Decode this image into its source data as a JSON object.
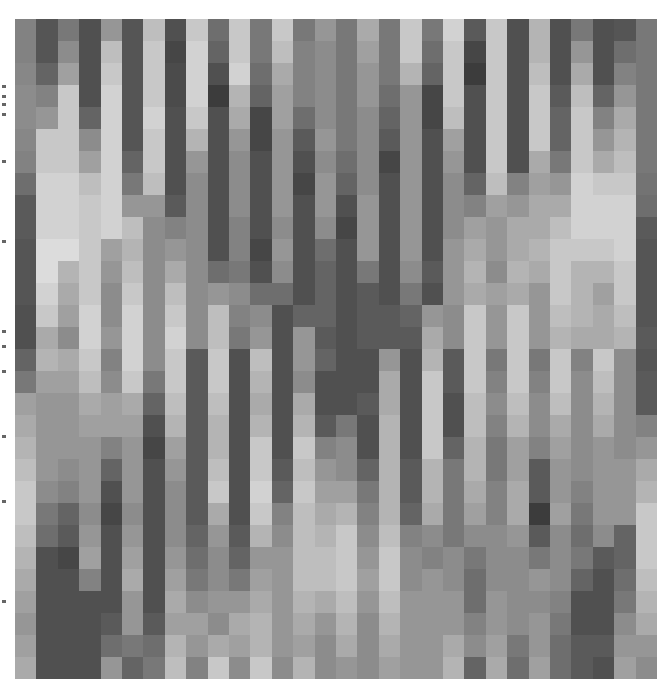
{
  "image": {
    "description": "grayscale pixel mosaic (30x30 grid of gray tiles)",
    "rows": 30,
    "cols": 30,
    "edge_marks_y": [
      85,
      95,
      103,
      113,
      160,
      240,
      330,
      345,
      370,
      435,
      500,
      600
    ]
  },
  "chart_data": {
    "type": "heatmap",
    "title": "",
    "xlabel": "",
    "ylabel": "",
    "colormap": "gray",
    "value_range": [
      0,
      255
    ],
    "grid": false,
    "matrix": [
      [
        130,
        85,
        120,
        80,
        150,
        85,
        190,
        80,
        200,
        110,
        200,
        120,
        200,
        120,
        150,
        120,
        170,
        120,
        200,
        120,
        210,
        90,
        200,
        80,
        180,
        80,
        120,
        80,
        85,
        120
      ],
      [
        130,
        85,
        140,
        80,
        190,
        85,
        200,
        70,
        210,
        100,
        200,
        120,
        190,
        130,
        140,
        120,
        160,
        120,
        200,
        110,
        200,
        70,
        200,
        80,
        180,
        80,
        150,
        80,
        110,
        120
      ],
      [
        135,
        100,
        160,
        80,
        200,
        85,
        200,
        75,
        210,
        80,
        210,
        110,
        170,
        130,
        140,
        120,
        150,
        120,
        180,
        100,
        200,
        60,
        200,
        80,
        190,
        80,
        170,
        80,
        130,
        120
      ],
      [
        140,
        130,
        200,
        80,
        210,
        85,
        200,
        75,
        210,
        60,
        180,
        100,
        160,
        130,
        140,
        120,
        150,
        110,
        150,
        70,
        200,
        80,
        200,
        80,
        200,
        90,
        190,
        100,
        150,
        120
      ],
      [
        140,
        150,
        200,
        100,
        210,
        85,
        210,
        80,
        200,
        80,
        170,
        70,
        160,
        110,
        140,
        120,
        140,
        100,
        150,
        70,
        190,
        80,
        200,
        80,
        200,
        100,
        200,
        130,
        170,
        120
      ],
      [
        135,
        200,
        200,
        140,
        210,
        85,
        200,
        80,
        180,
        80,
        150,
        70,
        150,
        90,
        150,
        120,
        140,
        90,
        150,
        80,
        160,
        80,
        200,
        80,
        200,
        100,
        200,
        150,
        180,
        120
      ],
      [
        130,
        200,
        200,
        160,
        210,
        100,
        200,
        80,
        150,
        80,
        140,
        80,
        150,
        80,
        140,
        110,
        140,
        70,
        150,
        80,
        150,
        80,
        200,
        80,
        170,
        120,
        200,
        170,
        190,
        120
      ],
      [
        110,
        210,
        210,
        190,
        210,
        120,
        190,
        80,
        140,
        80,
        140,
        80,
        150,
        70,
        150,
        100,
        140,
        80,
        150,
        80,
        140,
        100,
        190,
        130,
        160,
        150,
        210,
        200,
        200,
        115
      ],
      [
        90,
        210,
        210,
        200,
        210,
        150,
        150,
        90,
        140,
        80,
        140,
        80,
        150,
        80,
        150,
        80,
        150,
        80,
        150,
        80,
        140,
        130,
        160,
        150,
        170,
        170,
        210,
        210,
        210,
        110
      ],
      [
        90,
        210,
        210,
        200,
        210,
        190,
        140,
        130,
        140,
        80,
        130,
        80,
        140,
        80,
        140,
        70,
        150,
        80,
        150,
        80,
        140,
        160,
        150,
        170,
        170,
        190,
        210,
        210,
        210,
        90
      ],
      [
        85,
        220,
        220,
        200,
        160,
        180,
        140,
        150,
        140,
        80,
        130,
        70,
        150,
        80,
        110,
        80,
        150,
        80,
        150,
        80,
        150,
        170,
        150,
        170,
        180,
        200,
        200,
        200,
        210,
        85
      ],
      [
        85,
        220,
        180,
        200,
        150,
        190,
        140,
        170,
        140,
        110,
        120,
        80,
        140,
        80,
        100,
        80,
        120,
        80,
        140,
        90,
        150,
        180,
        140,
        180,
        170,
        200,
        180,
        180,
        200,
        85
      ],
      [
        85,
        210,
        170,
        200,
        140,
        200,
        140,
        190,
        140,
        150,
        140,
        110,
        110,
        80,
        100,
        80,
        90,
        80,
        120,
        80,
        150,
        170,
        160,
        170,
        150,
        200,
        180,
        160,
        200,
        85
      ],
      [
        80,
        200,
        160,
        210,
        140,
        210,
        140,
        200,
        140,
        190,
        130,
        140,
        80,
        100,
        100,
        80,
        90,
        90,
        100,
        150,
        140,
        200,
        150,
        200,
        150,
        190,
        180,
        170,
        190,
        85
      ],
      [
        80,
        170,
        140,
        210,
        150,
        210,
        140,
        210,
        140,
        190,
        120,
        150,
        80,
        150,
        90,
        80,
        90,
        90,
        90,
        170,
        140,
        200,
        150,
        200,
        150,
        180,
        170,
        170,
        180,
        90
      ],
      [
        100,
        180,
        170,
        200,
        130,
        210,
        140,
        200,
        90,
        200,
        80,
        190,
        80,
        150,
        100,
        80,
        80,
        150,
        80,
        180,
        90,
        200,
        120,
        200,
        120,
        200,
        130,
        200,
        140,
        85
      ],
      [
        120,
        160,
        160,
        190,
        140,
        200,
        120,
        200,
        90,
        200,
        80,
        180,
        80,
        140,
        80,
        80,
        80,
        170,
        80,
        200,
        90,
        200,
        130,
        200,
        130,
        200,
        140,
        190,
        140,
        90
      ],
      [
        160,
        150,
        150,
        170,
        160,
        170,
        100,
        190,
        90,
        190,
        80,
        170,
        80,
        170,
        80,
        80,
        90,
        170,
        80,
        200,
        80,
        190,
        140,
        190,
        140,
        190,
        140,
        180,
        140,
        90
      ],
      [
        170,
        150,
        150,
        160,
        160,
        160,
        80,
        180,
        90,
        180,
        80,
        180,
        80,
        180,
        90,
        120,
        80,
        180,
        80,
        200,
        80,
        190,
        130,
        180,
        140,
        170,
        140,
        170,
        140,
        130
      ],
      [
        180,
        150,
        150,
        150,
        130,
        150,
        70,
        160,
        90,
        180,
        80,
        200,
        80,
        200,
        130,
        140,
        80,
        180,
        80,
        200,
        100,
        180,
        120,
        160,
        130,
        160,
        140,
        150,
        140,
        150
      ],
      [
        190,
        150,
        140,
        150,
        100,
        150,
        80,
        150,
        90,
        190,
        80,
        200,
        90,
        190,
        150,
        140,
        100,
        180,
        90,
        180,
        120,
        180,
        120,
        160,
        90,
        150,
        140,
        150,
        150,
        170
      ],
      [
        200,
        140,
        130,
        150,
        80,
        150,
        80,
        140,
        90,
        200,
        80,
        210,
        100,
        200,
        160,
        160,
        120,
        180,
        90,
        180,
        120,
        170,
        130,
        170,
        90,
        150,
        130,
        150,
        150,
        180
      ],
      [
        200,
        120,
        100,
        140,
        70,
        140,
        80,
        140,
        90,
        170,
        80,
        200,
        130,
        190,
        170,
        180,
        130,
        180,
        100,
        170,
        120,
        160,
        130,
        170,
        60,
        160,
        120,
        150,
        150,
        200
      ],
      [
        190,
        110,
        90,
        150,
        80,
        150,
        80,
        140,
        100,
        150,
        90,
        180,
        140,
        190,
        180,
        200,
        140,
        190,
        130,
        140,
        120,
        140,
        140,
        150,
        90,
        140,
        110,
        140,
        100,
        200
      ],
      [
        180,
        80,
        70,
        160,
        80,
        160,
        80,
        150,
        110,
        140,
        100,
        150,
        150,
        190,
        190,
        200,
        150,
        200,
        140,
        130,
        140,
        120,
        140,
        140,
        120,
        140,
        120,
        90,
        100,
        200
      ],
      [
        170,
        80,
        80,
        130,
        80,
        170,
        80,
        160,
        120,
        140,
        120,
        160,
        150,
        190,
        190,
        200,
        160,
        200,
        140,
        150,
        140,
        110,
        140,
        140,
        150,
        140,
        100,
        80,
        110,
        190
      ],
      [
        160,
        80,
        80,
        80,
        80,
        150,
        80,
        170,
        140,
        150,
        150,
        170,
        150,
        180,
        170,
        190,
        150,
        190,
        150,
        150,
        150,
        110,
        150,
        140,
        140,
        130,
        80,
        80,
        120,
        180
      ],
      [
        150,
        80,
        80,
        80,
        90,
        150,
        90,
        160,
        160,
        140,
        170,
        180,
        150,
        170,
        150,
        180,
        140,
        180,
        150,
        150,
        150,
        130,
        150,
        140,
        150,
        120,
        80,
        80,
        140,
        170
      ],
      [
        160,
        80,
        80,
        80,
        110,
        120,
        110,
        180,
        150,
        170,
        160,
        180,
        150,
        160,
        140,
        170,
        140,
        170,
        150,
        150,
        170,
        140,
        160,
        120,
        150,
        110,
        90,
        90,
        150,
        150
      ],
      [
        170,
        80,
        80,
        80,
        150,
        100,
        120,
        190,
        130,
        200,
        140,
        200,
        140,
        180,
        140,
        150,
        140,
        160,
        150,
        150,
        180,
        100,
        170,
        110,
        160,
        110,
        90,
        80,
        160,
        140
      ]
    ]
  }
}
